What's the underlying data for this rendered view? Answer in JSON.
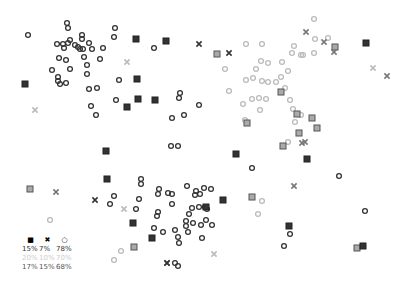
{
  "chart_data": {
    "type": "scatter",
    "title": "",
    "xlabel": "",
    "ylabel": "",
    "grid": false,
    "axes_visible": false,
    "legend_position": "bottom-left",
    "colors": {
      "dark": "#333333",
      "light": "#bbbbbb",
      "medium": "#777777"
    },
    "marker_types": [
      "square",
      "x",
      "circle"
    ],
    "legend": {
      "header": [
        "square",
        "x",
        "circle"
      ],
      "rows": [
        {
          "shade": "dark",
          "values": [
            "15%",
            "7%",
            "78%"
          ]
        },
        {
          "shade": "light",
          "values": [
            "20%",
            "10%",
            "70%"
          ]
        },
        {
          "shade": "medium",
          "values": [
            "17%",
            "15%",
            "68%"
          ]
        }
      ]
    },
    "series": [
      {
        "name": "group-dark-topleft",
        "shade": "dark",
        "points": [
          {
            "x": 67,
            "y": 23,
            "m": "circle"
          },
          {
            "x": 68,
            "y": 28,
            "m": "circle"
          },
          {
            "x": 28,
            "y": 35,
            "m": "circle"
          },
          {
            "x": 115,
            "y": 28,
            "m": "circle"
          },
          {
            "x": 114,
            "y": 37,
            "m": "circle"
          },
          {
            "x": 57,
            "y": 44,
            "m": "circle"
          },
          {
            "x": 63,
            "y": 44,
            "m": "circle"
          },
          {
            "x": 68,
            "y": 43,
            "m": "circle"
          },
          {
            "x": 70,
            "y": 40,
            "m": "circle"
          },
          {
            "x": 64,
            "y": 48,
            "m": "circle"
          },
          {
            "x": 75,
            "y": 45,
            "m": "circle"
          },
          {
            "x": 78,
            "y": 47,
            "m": "circle"
          },
          {
            "x": 82,
            "y": 35,
            "m": "circle"
          },
          {
            "x": 82,
            "y": 39,
            "m": "circle"
          },
          {
            "x": 80,
            "y": 49,
            "m": "circle"
          },
          {
            "x": 83,
            "y": 49,
            "m": "circle"
          },
          {
            "x": 89,
            "y": 43,
            "m": "circle"
          },
          {
            "x": 92,
            "y": 49,
            "m": "circle"
          },
          {
            "x": 103,
            "y": 48,
            "m": "circle"
          },
          {
            "x": 59,
            "y": 58,
            "m": "circle"
          },
          {
            "x": 66,
            "y": 60,
            "m": "circle"
          },
          {
            "x": 84,
            "y": 57,
            "m": "circle"
          },
          {
            "x": 100,
            "y": 59,
            "m": "circle"
          },
          {
            "x": 87,
            "y": 65,
            "m": "circle"
          },
          {
            "x": 52,
            "y": 70,
            "m": "circle"
          },
          {
            "x": 70,
            "y": 69,
            "m": "circle"
          },
          {
            "x": 87,
            "y": 74,
            "m": "circle"
          },
          {
            "x": 58,
            "y": 77,
            "m": "circle"
          },
          {
            "x": 58,
            "y": 81,
            "m": "circle"
          },
          {
            "x": 60,
            "y": 84,
            "m": "circle"
          },
          {
            "x": 66,
            "y": 83,
            "m": "circle"
          },
          {
            "x": 119,
            "y": 80,
            "m": "circle"
          },
          {
            "x": 97,
            "y": 88,
            "m": "circle"
          },
          {
            "x": 89,
            "y": 89,
            "m": "circle"
          },
          {
            "x": 116,
            "y": 100,
            "m": "circle"
          },
          {
            "x": 91,
            "y": 106,
            "m": "circle"
          },
          {
            "x": 96,
            "y": 115,
            "m": "circle"
          },
          {
            "x": 25,
            "y": 84,
            "m": "square"
          },
          {
            "x": 136,
            "y": 39,
            "m": "square"
          },
          {
            "x": 137,
            "y": 79,
            "m": "square"
          },
          {
            "x": 127,
            "y": 107,
            "m": "square"
          },
          {
            "x": 166,
            "y": 41,
            "m": "square"
          },
          {
            "x": 138,
            "y": 99,
            "m": "square"
          },
          {
            "x": 155,
            "y": 100,
            "m": "square"
          },
          {
            "x": 236,
            "y": 154,
            "m": "square"
          },
          {
            "x": 154,
            "y": 48,
            "m": "circle"
          },
          {
            "x": 180,
            "y": 93,
            "m": "circle"
          },
          {
            "x": 179,
            "y": 98,
            "m": "circle"
          },
          {
            "x": 199,
            "y": 105,
            "m": "circle"
          },
          {
            "x": 184,
            "y": 115,
            "m": "circle"
          },
          {
            "x": 172,
            "y": 118,
            "m": "circle"
          },
          {
            "x": 171,
            "y": 146,
            "m": "circle"
          },
          {
            "x": 178,
            "y": 146,
            "m": "circle"
          },
          {
            "x": 199,
            "y": 44,
            "m": "x"
          },
          {
            "x": 229,
            "y": 53,
            "m": "x"
          }
        ]
      },
      {
        "name": "group-light-topright",
        "shade": "light",
        "points": [
          {
            "x": 246,
            "y": 44,
            "m": "circle"
          },
          {
            "x": 262,
            "y": 44,
            "m": "circle"
          },
          {
            "x": 314,
            "y": 19,
            "m": "circle"
          },
          {
            "x": 315,
            "y": 39,
            "m": "circle"
          },
          {
            "x": 294,
            "y": 46,
            "m": "circle"
          },
          {
            "x": 292,
            "y": 53,
            "m": "circle"
          },
          {
            "x": 301,
            "y": 55,
            "m": "circle"
          },
          {
            "x": 225,
            "y": 69,
            "m": "circle"
          },
          {
            "x": 261,
            "y": 61,
            "m": "circle"
          },
          {
            "x": 268,
            "y": 63,
            "m": "circle"
          },
          {
            "x": 282,
            "y": 62,
            "m": "circle"
          },
          {
            "x": 256,
            "y": 69,
            "m": "circle"
          },
          {
            "x": 288,
            "y": 71,
            "m": "circle"
          },
          {
            "x": 246,
            "y": 80,
            "m": "circle"
          },
          {
            "x": 253,
            "y": 78,
            "m": "circle"
          },
          {
            "x": 262,
            "y": 81,
            "m": "circle"
          },
          {
            "x": 268,
            "y": 82,
            "m": "circle"
          },
          {
            "x": 276,
            "y": 82,
            "m": "circle"
          },
          {
            "x": 281,
            "y": 77,
            "m": "circle"
          },
          {
            "x": 229,
            "y": 91,
            "m": "circle"
          },
          {
            "x": 252,
            "y": 99,
            "m": "circle"
          },
          {
            "x": 259,
            "y": 98,
            "m": "circle"
          },
          {
            "x": 266,
            "y": 99,
            "m": "circle"
          },
          {
            "x": 243,
            "y": 104,
            "m": "circle"
          },
          {
            "x": 260,
            "y": 110,
            "m": "circle"
          },
          {
            "x": 285,
            "y": 88,
            "m": "circle"
          },
          {
            "x": 290,
            "y": 100,
            "m": "circle"
          },
          {
            "x": 293,
            "y": 109,
            "m": "circle"
          },
          {
            "x": 301,
            "y": 115,
            "m": "circle"
          },
          {
            "x": 295,
            "y": 122,
            "m": "circle"
          },
          {
            "x": 245,
            "y": 120,
            "m": "circle"
          },
          {
            "x": 288,
            "y": 142,
            "m": "circle"
          },
          {
            "x": 328,
            "y": 38,
            "m": "circle"
          },
          {
            "x": 314,
            "y": 53,
            "m": "circle"
          },
          {
            "x": 303,
            "y": 55,
            "m": "circle"
          },
          {
            "x": 127,
            "y": 62,
            "m": "x"
          },
          {
            "x": 35,
            "y": 110,
            "m": "x"
          },
          {
            "x": 373,
            "y": 68,
            "m": "x"
          },
          {
            "x": 124,
            "y": 209,
            "m": "x"
          },
          {
            "x": 214,
            "y": 254,
            "m": "x"
          },
          {
            "x": 50,
            "y": 220,
            "m": "circle"
          },
          {
            "x": 121,
            "y": 251,
            "m": "circle"
          },
          {
            "x": 114,
            "y": 260,
            "m": "circle"
          },
          {
            "x": 262,
            "y": 201,
            "m": "circle"
          },
          {
            "x": 258,
            "y": 214,
            "m": "circle"
          }
        ]
      },
      {
        "name": "group-medium-scattered",
        "shade": "medium",
        "points": [
          {
            "x": 217,
            "y": 54,
            "m": "square"
          },
          {
            "x": 335,
            "y": 47,
            "m": "square"
          },
          {
            "x": 281,
            "y": 92,
            "m": "square"
          },
          {
            "x": 247,
            "y": 123,
            "m": "square"
          },
          {
            "x": 297,
            "y": 114,
            "m": "square"
          },
          {
            "x": 312,
            "y": 118,
            "m": "square"
          },
          {
            "x": 317,
            "y": 128,
            "m": "square"
          },
          {
            "x": 299,
            "y": 133,
            "m": "square"
          },
          {
            "x": 283,
            "y": 146,
            "m": "square"
          },
          {
            "x": 30,
            "y": 189,
            "m": "square"
          },
          {
            "x": 134,
            "y": 247,
            "m": "square"
          },
          {
            "x": 252,
            "y": 197,
            "m": "square"
          },
          {
            "x": 357,
            "y": 248,
            "m": "square"
          },
          {
            "x": 306,
            "y": 32,
            "m": "x"
          },
          {
            "x": 324,
            "y": 42,
            "m": "x"
          },
          {
            "x": 334,
            "y": 52,
            "m": "x"
          },
          {
            "x": 387,
            "y": 76,
            "m": "x"
          },
          {
            "x": 305,
            "y": 142,
            "m": "x"
          },
          {
            "x": 302,
            "y": 143,
            "m": "x"
          },
          {
            "x": 56,
            "y": 192,
            "m": "x"
          },
          {
            "x": 294,
            "y": 186,
            "m": "x"
          },
          {
            "x": 167,
            "y": 263,
            "m": "x"
          }
        ]
      },
      {
        "name": "group-dark-bottom",
        "shade": "dark",
        "points": [
          {
            "x": 141,
            "y": 179,
            "m": "circle"
          },
          {
            "x": 141,
            "y": 184,
            "m": "circle"
          },
          {
            "x": 114,
            "y": 196,
            "m": "circle"
          },
          {
            "x": 110,
            "y": 204,
            "m": "circle"
          },
          {
            "x": 139,
            "y": 199,
            "m": "circle"
          },
          {
            "x": 136,
            "y": 209,
            "m": "circle"
          },
          {
            "x": 159,
            "y": 189,
            "m": "circle"
          },
          {
            "x": 158,
            "y": 194,
            "m": "circle"
          },
          {
            "x": 168,
            "y": 193,
            "m": "circle"
          },
          {
            "x": 172,
            "y": 194,
            "m": "circle"
          },
          {
            "x": 187,
            "y": 186,
            "m": "circle"
          },
          {
            "x": 195,
            "y": 195,
            "m": "circle"
          },
          {
            "x": 200,
            "y": 194,
            "m": "circle"
          },
          {
            "x": 196,
            "y": 191,
            "m": "circle"
          },
          {
            "x": 204,
            "y": 188,
            "m": "circle"
          },
          {
            "x": 211,
            "y": 189,
            "m": "circle"
          },
          {
            "x": 172,
            "y": 204,
            "m": "circle"
          },
          {
            "x": 158,
            "y": 212,
            "m": "circle"
          },
          {
            "x": 157,
            "y": 216,
            "m": "circle"
          },
          {
            "x": 189,
            "y": 214,
            "m": "circle"
          },
          {
            "x": 192,
            "y": 208,
            "m": "circle"
          },
          {
            "x": 199,
            "y": 207,
            "m": "circle"
          },
          {
            "x": 186,
            "y": 221,
            "m": "circle"
          },
          {
            "x": 186,
            "y": 226,
            "m": "circle"
          },
          {
            "x": 193,
            "y": 223,
            "m": "circle"
          },
          {
            "x": 201,
            "y": 225,
            "m": "circle"
          },
          {
            "x": 212,
            "y": 225,
            "m": "circle"
          },
          {
            "x": 206,
            "y": 220,
            "m": "circle"
          },
          {
            "x": 154,
            "y": 228,
            "m": "circle"
          },
          {
            "x": 163,
            "y": 232,
            "m": "circle"
          },
          {
            "x": 175,
            "y": 230,
            "m": "circle"
          },
          {
            "x": 178,
            "y": 237,
            "m": "circle"
          },
          {
            "x": 179,
            "y": 243,
            "m": "circle"
          },
          {
            "x": 188,
            "y": 232,
            "m": "circle"
          },
          {
            "x": 205,
            "y": 207,
            "m": "circle"
          },
          {
            "x": 175,
            "y": 263,
            "m": "circle"
          },
          {
            "x": 178,
            "y": 266,
            "m": "circle"
          },
          {
            "x": 202,
            "y": 238,
            "m": "circle"
          },
          {
            "x": 207,
            "y": 209,
            "m": "circle"
          },
          {
            "x": 252,
            "y": 168,
            "m": "circle"
          },
          {
            "x": 339,
            "y": 176,
            "m": "circle"
          },
          {
            "x": 365,
            "y": 211,
            "m": "circle"
          },
          {
            "x": 290,
            "y": 234,
            "m": "circle"
          },
          {
            "x": 284,
            "y": 246,
            "m": "circle"
          },
          {
            "x": 107,
            "y": 179,
            "m": "square"
          },
          {
            "x": 133,
            "y": 223,
            "m": "square"
          },
          {
            "x": 152,
            "y": 238,
            "m": "square"
          },
          {
            "x": 223,
            "y": 200,
            "m": "square"
          },
          {
            "x": 206,
            "y": 207,
            "m": "square"
          },
          {
            "x": 307,
            "y": 159,
            "m": "square"
          },
          {
            "x": 289,
            "y": 226,
            "m": "square"
          },
          {
            "x": 363,
            "y": 246,
            "m": "square"
          },
          {
            "x": 366,
            "y": 43,
            "m": "square"
          },
          {
            "x": 106,
            "y": 151,
            "m": "square"
          },
          {
            "x": 95,
            "y": 200,
            "m": "x"
          },
          {
            "x": 167,
            "y": 263,
            "m": "x"
          }
        ]
      }
    ]
  }
}
